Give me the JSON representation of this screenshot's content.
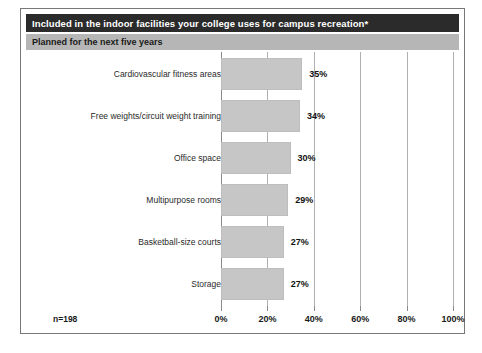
{
  "header": {
    "title": "Included in the indoor facilities your college uses for campus recreation*",
    "subtitle": "Planned for the next five years"
  },
  "footer": {
    "sample_size": "n=198"
  },
  "colors": {
    "title_bar": "#2b2b2b",
    "subtitle_bar": "#b6b6b6",
    "bar_fill": "#c6c6c6",
    "frame": "#777777",
    "gridline": "#b0b0b0"
  },
  "chart_data": {
    "type": "bar",
    "orientation": "horizontal",
    "title": "Included in the indoor facilities your college uses for campus recreation*",
    "subtitle": "Planned for the next five years",
    "categories": [
      "Cardiovascular fitness areas",
      "Free weights/circuit weight training",
      "Office space",
      "Multipurpose rooms",
      "Basketball-size courts",
      "Storage"
    ],
    "values": [
      35,
      34,
      30,
      29,
      27,
      27
    ],
    "value_labels": [
      "35%",
      "34%",
      "30%",
      "29%",
      "27%",
      "27%"
    ],
    "xlabel": "",
    "ylabel": "",
    "xlim": [
      0,
      100
    ],
    "xticks": [
      0,
      20,
      40,
      60,
      80,
      100
    ],
    "xtick_labels": [
      "0%",
      "20%",
      "40%",
      "60%",
      "80%",
      "100%"
    ],
    "grid": true,
    "legend": false,
    "note": "n=198"
  }
}
